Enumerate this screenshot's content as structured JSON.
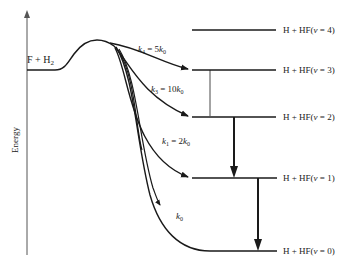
{
  "diagram": {
    "axis_label": "Energy",
    "reactants": {
      "label_main": "F + H",
      "label_sub": "2"
    },
    "levels": [
      {
        "v": 4,
        "prefix": "H + HF(",
        "var": "v",
        "suffix": " = 4)",
        "y": 30
      },
      {
        "v": 3,
        "prefix": "H + HF(",
        "var": "v",
        "suffix": " = 3)",
        "y": 70
      },
      {
        "v": 2,
        "prefix": "H + HF(",
        "var": "v",
        "suffix": " = 2)",
        "y": 117
      },
      {
        "v": 1,
        "prefix": "H + HF(",
        "var": "v",
        "suffix": " = 1)",
        "y": 178
      },
      {
        "v": 0,
        "prefix": "H + HF(",
        "var": "v",
        "suffix": " = 0)",
        "y": 251
      }
    ],
    "rates": [
      {
        "name": "k4",
        "k": "k",
        "sub": "4",
        "eq": " = 5",
        "k2": "k",
        "sub2": "0"
      },
      {
        "name": "k3",
        "k": "k",
        "sub": "3",
        "eq": " = 10",
        "k2": "k",
        "sub2": "0"
      },
      {
        "name": "k1",
        "k": "k",
        "sub": "1",
        "eq": " = 2",
        "k2": "k",
        "sub2": "0"
      },
      {
        "name": "k0",
        "k": "k",
        "sub": "0"
      }
    ],
    "colors": {
      "line": "#1a1a1a",
      "background": "#ffffff"
    }
  }
}
